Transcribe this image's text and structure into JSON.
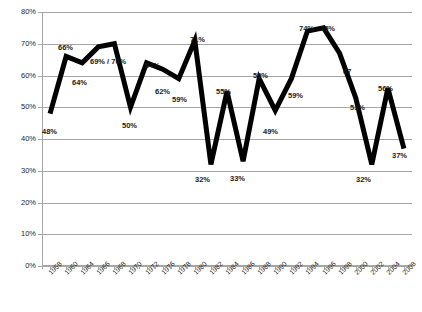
{
  "chart_data": {
    "type": "line",
    "title": "",
    "subtitle": "",
    "xlabel": "",
    "ylabel": "",
    "ylim": [
      0,
      80
    ],
    "ytick_labels": [
      "0%",
      "10%",
      "20%",
      "30%",
      "40%",
      "50%",
      "60%",
      "70%",
      "80%"
    ],
    "ytick_values": [
      0,
      10,
      20,
      30,
      40,
      50,
      60,
      70,
      80
    ],
    "grid": true,
    "legend": "none",
    "categories": [
      "1958",
      "1960",
      "1964",
      "1966",
      "1968",
      "1970",
      "1972",
      "1976",
      "1978",
      "1980",
      "1982",
      "1984",
      "1986",
      "1988",
      "1990",
      "1992",
      "1994",
      "1996",
      "1998",
      "2000",
      "2002",
      "2004",
      "2008"
    ],
    "values": [
      48,
      66,
      64,
      69,
      70,
      50,
      64,
      62,
      59,
      71,
      32,
      55,
      33,
      59,
      49,
      59,
      74,
      75,
      67,
      53,
      32,
      56,
      37
    ],
    "point_labels": [
      {
        "x": "1958",
        "value": 48,
        "text": "48%"
      },
      {
        "x": "1960",
        "value": 66,
        "text": "66%"
      },
      {
        "x": "1964",
        "value": 64,
        "text": "64%"
      },
      {
        "x": "1966",
        "value": 69,
        "text": "69% / 70%"
      },
      {
        "x": "1970",
        "value": 50,
        "text": "50%"
      },
      {
        "x": "1972",
        "value": 64,
        "text": "64%"
      },
      {
        "x": "1976",
        "value": 62,
        "text": "62%"
      },
      {
        "x": "1978",
        "value": 59,
        "text": "59%"
      },
      {
        "x": "1980",
        "value": 71,
        "text": "71%"
      },
      {
        "x": "1982",
        "value": 32,
        "text": "32%"
      },
      {
        "x": "1984",
        "value": 55,
        "text": "55%"
      },
      {
        "x": "1986",
        "value": 33,
        "text": "33%"
      },
      {
        "x": "1988",
        "value": 59,
        "text": "59%"
      },
      {
        "x": "1990",
        "value": 49,
        "text": "49%"
      },
      {
        "x": "1992",
        "value": 59,
        "text": "59%"
      },
      {
        "x": "1994",
        "value": 74,
        "text": "74%"
      },
      {
        "x": "1996",
        "value": 75,
        "text": "75%"
      },
      {
        "x": "1998",
        "value": 67,
        "text": "67"
      },
      {
        "x": "2000",
        "value": 53,
        "text": "53%"
      },
      {
        "x": "2002",
        "value": 32,
        "text": "32%"
      },
      {
        "x": "2004",
        "value": 56,
        "text": "56%"
      },
      {
        "x": "2008",
        "value": 37,
        "text": "37%"
      }
    ],
    "series_color": "#000000",
    "grid_color": "#a6a6a6",
    "background": "#ffffff"
  },
  "label_positions": [
    {
      "name": "label-1958",
      "text": "48%",
      "left": 42,
      "top": 128
    },
    {
      "name": "label-1960",
      "text": "66%",
      "left": 58,
      "top": 44
    },
    {
      "name": "label-1964",
      "text": "64%",
      "left": 72,
      "top": 79
    },
    {
      "name": "label-1966",
      "text": "69% / 70%",
      "left": 90,
      "top": 58
    },
    {
      "name": "label-1970",
      "text": "50%",
      "left": 122,
      "top": 122
    },
    {
      "name": "label-1972",
      "text": "64%",
      "left": 145,
      "top": 62
    },
    {
      "name": "label-1976",
      "text": "62%",
      "left": 155,
      "top": 88
    },
    {
      "name": "label-1978",
      "text": "59%",
      "left": 172,
      "top": 96
    },
    {
      "name": "label-1980",
      "text": "71%",
      "left": 190,
      "top": 36
    },
    {
      "name": "label-1982",
      "text": "32%",
      "left": 195,
      "top": 176
    },
    {
      "name": "label-1984",
      "text": "55%",
      "left": 216,
      "top": 88
    },
    {
      "name": "label-1986",
      "text": "33%",
      "left": 230,
      "top": 175
    },
    {
      "name": "label-1988",
      "text": "59%",
      "left": 253,
      "top": 72
    },
    {
      "name": "label-1990",
      "text": "49%",
      "left": 263,
      "top": 128
    },
    {
      "name": "label-1992",
      "text": "59%",
      "left": 288,
      "top": 92
    },
    {
      "name": "label-1994",
      "text": "74%",
      "left": 299,
      "top": 25
    },
    {
      "name": "label-1996",
      "text": "75%",
      "left": 320,
      "top": 25
    },
    {
      "name": "label-1998",
      "text": "67",
      "left": 343,
      "top": 68
    },
    {
      "name": "label-2000",
      "text": "53%",
      "left": 350,
      "top": 104
    },
    {
      "name": "label-2002",
      "text": "32%",
      "left": 356,
      "top": 176
    },
    {
      "name": "label-2004",
      "text": "56%",
      "left": 378,
      "top": 85
    },
    {
      "name": "label-2008",
      "text": "37%",
      "left": 392,
      "top": 152
    }
  ]
}
